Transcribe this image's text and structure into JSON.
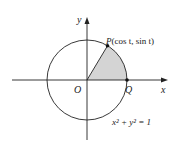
{
  "diagram": {
    "labels": {
      "y_axis": "y",
      "x_axis": "x",
      "origin": "O",
      "point_q": "Q",
      "point_p_name": "P",
      "point_p_coords": "(cos t, sin t)",
      "equation": "x² + y² = 1"
    },
    "colors": {
      "sector_fill": "#d4d4d4",
      "lines": "#222222"
    }
  }
}
